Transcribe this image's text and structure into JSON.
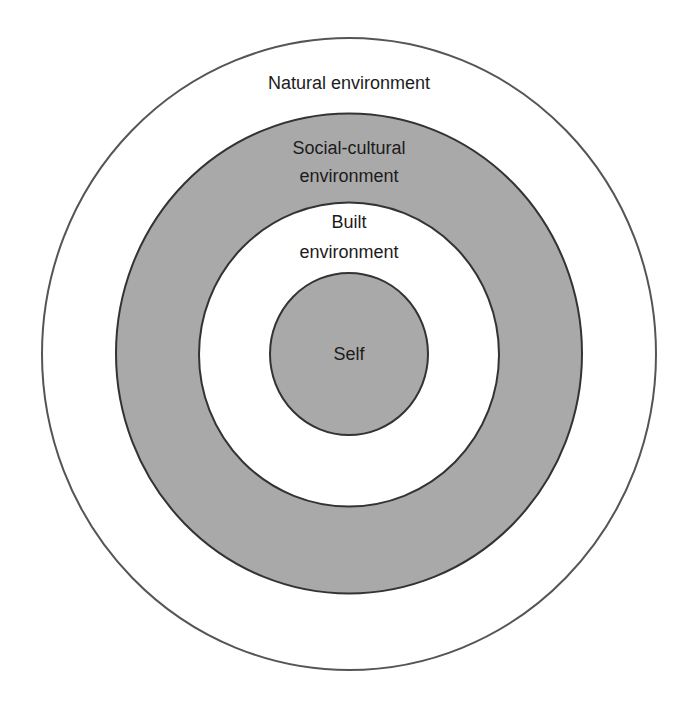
{
  "diagram": {
    "type": "concentric-circles",
    "colors": {
      "ring_fill": "#a9a9a9",
      "background": "#ffffff",
      "stroke": "#333333",
      "text": "#1c1c1c"
    },
    "layers": [
      {
        "name": "natural",
        "line1": "Natural environment",
        "line2": ""
      },
      {
        "name": "social-cultural",
        "line1": "Social-cultural",
        "line2": "environment"
      },
      {
        "name": "built",
        "line1": "Built",
        "line2": "environment"
      },
      {
        "name": "self",
        "line1": "Self",
        "line2": ""
      }
    ]
  }
}
